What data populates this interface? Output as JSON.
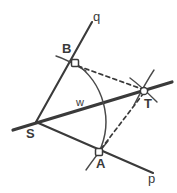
{
  "figure": {
    "background_color": "#ffffff",
    "ink_color": "#3a3a3a",
    "width": 177,
    "height": 193
  },
  "labels": {
    "vertex_s": "S",
    "vertex_a": "A",
    "vertex_b": "B",
    "vertex_t": "T",
    "ray_p": "p",
    "ray_q": "q",
    "angle_w": "w"
  },
  "geometry": {
    "points": {
      "S": {
        "x": 36,
        "y": 122
      },
      "B": {
        "x": 75,
        "y": 63
      },
      "A": {
        "x": 99,
        "y": 152
      },
      "T": {
        "x": 144,
        "y": 91
      }
    },
    "rays": [
      {
        "name": "q",
        "from": "S",
        "through": "B",
        "tip_x": 92,
        "tip_y": 22
      },
      {
        "name": "p",
        "from": "S",
        "through": "A",
        "tip_x": 153,
        "tip_y": 173
      },
      {
        "name": "bisector",
        "from": "S",
        "through": "T",
        "tail_x": 13,
        "tail_y": 130,
        "tip_x": 172,
        "tip_y": 82
      }
    ],
    "dashed_segments": [
      {
        "from": "B",
        "to": "T"
      },
      {
        "from": "A",
        "to": "T"
      }
    ],
    "arcs": [
      {
        "name": "arc-from-S",
        "center": "S",
        "from": "B",
        "to": "A"
      },
      {
        "name": "arc-at-B",
        "center": "B"
      },
      {
        "name": "arc-at-A",
        "center": "A"
      },
      {
        "name": "arc-at-T-1",
        "center": "T"
      },
      {
        "name": "arc-at-T-2",
        "center": "T"
      }
    ]
  }
}
